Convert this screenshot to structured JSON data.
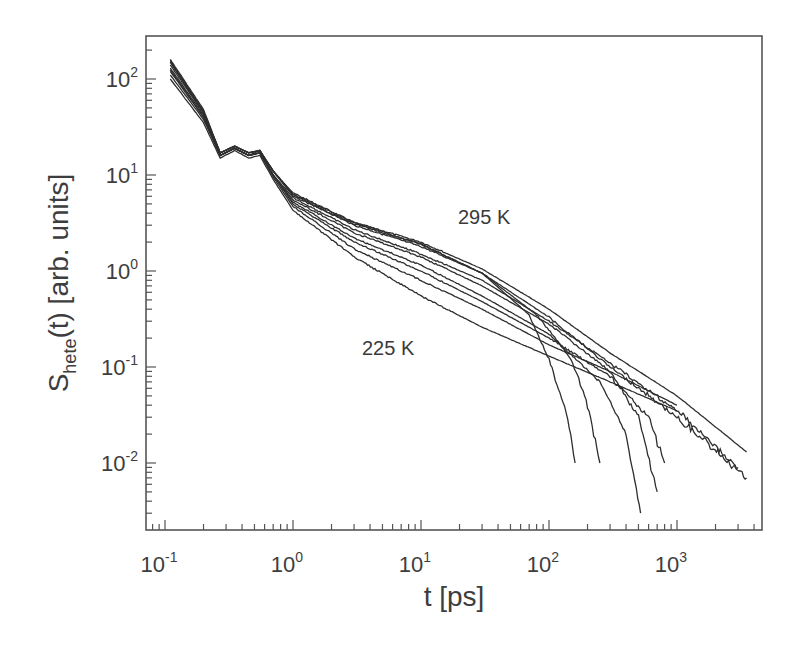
{
  "chart_data": {
    "type": "line",
    "title": "",
    "xlabel": "t [ps]",
    "ylabel": "S_hete(t)  [arb. units]",
    "ylabel_main": "S",
    "ylabel_sub": "hete",
    "ylabel_rest": "(t)  [arb. units]",
    "xscale": "log",
    "yscale": "log",
    "xlim": [
      0.07,
      4900
    ],
    "ylim": [
      0.002,
      290
    ],
    "grid": false,
    "legend": "none",
    "x_ticks": [
      {
        "base": "10",
        "exp": "-1",
        "value": 0.1
      },
      {
        "base": "10",
        "exp": "0",
        "value": 1
      },
      {
        "base": "10",
        "exp": "1",
        "value": 10
      },
      {
        "base": "10",
        "exp": "2",
        "value": 100
      },
      {
        "base": "10",
        "exp": "3",
        "value": 1000
      }
    ],
    "y_ticks": [
      {
        "base": "10",
        "exp": "2",
        "value": 100
      },
      {
        "base": "10",
        "exp": "1",
        "value": 10
      },
      {
        "base": "10",
        "exp": "0",
        "value": 1
      },
      {
        "base": "10",
        "exp": "-1",
        "value": 0.1
      },
      {
        "base": "10",
        "exp": "-2",
        "value": 0.01
      }
    ],
    "annotations": [
      {
        "text": "295 K",
        "x": 40,
        "y": 3.0
      },
      {
        "text": "225 K",
        "x": 4,
        "y": 0.12
      }
    ],
    "series_description": "Ten temperature curves from 225 K to 295 K; all coincide below ~1 ps and fan out at longer times; several curves drop sharply (noisy) between 100 and 800 ps.",
    "series": [
      {
        "name": "curve-1",
        "cutoff": 3500,
        "noisy_end": false,
        "points": [
          [
            0.11,
            150
          ],
          [
            0.2,
            45
          ],
          [
            0.27,
            17
          ],
          [
            0.35,
            20
          ],
          [
            0.45,
            17
          ],
          [
            0.55,
            18
          ],
          [
            0.7,
            11
          ],
          [
            1,
            6.5
          ],
          [
            3,
            3.2
          ],
          [
            10,
            2.0
          ],
          [
            30,
            1.05
          ],
          [
            100,
            0.4
          ],
          [
            300,
            0.14
          ],
          [
            1000,
            0.05
          ],
          [
            3500,
            0.013
          ]
        ]
      },
      {
        "name": "curve-2",
        "cutoff": 3500,
        "noisy_end": true,
        "points": [
          [
            0.11,
            160
          ],
          [
            0.2,
            48
          ],
          [
            0.27,
            17
          ],
          [
            0.35,
            20
          ],
          [
            0.45,
            17
          ],
          [
            0.55,
            18
          ],
          [
            0.7,
            11
          ],
          [
            1,
            6.2
          ],
          [
            3,
            3.0
          ],
          [
            10,
            1.8
          ],
          [
            30,
            0.95
          ],
          [
            100,
            0.33
          ],
          [
            300,
            0.1
          ],
          [
            1000,
            0.03
          ],
          [
            3500,
            0.007
          ]
        ]
      },
      {
        "name": "curve-3",
        "cutoff": 3000,
        "noisy_end": true,
        "points": [
          [
            0.11,
            140
          ],
          [
            0.2,
            44
          ],
          [
            0.27,
            16
          ],
          [
            0.35,
            19
          ],
          [
            0.45,
            16
          ],
          [
            0.55,
            18
          ],
          [
            0.7,
            10
          ],
          [
            1,
            5.8
          ],
          [
            3,
            2.7
          ],
          [
            10,
            1.5
          ],
          [
            30,
            0.8
          ],
          [
            100,
            0.3
          ],
          [
            300,
            0.11
          ],
          [
            1000,
            0.035
          ],
          [
            3000,
            0.009
          ]
        ]
      },
      {
        "name": "curve-4",
        "cutoff": 250,
        "noisy_end": true,
        "points": [
          [
            0.11,
            150
          ],
          [
            0.2,
            45
          ],
          [
            0.27,
            17
          ],
          [
            0.35,
            20
          ],
          [
            0.45,
            17
          ],
          [
            0.55,
            18
          ],
          [
            0.7,
            11
          ],
          [
            1,
            6.0
          ],
          [
            3,
            3.1
          ],
          [
            10,
            1.9
          ],
          [
            30,
            0.95
          ],
          [
            80,
            0.35
          ],
          [
            150,
            0.12
          ],
          [
            200,
            0.04
          ],
          [
            250,
            0.01
          ]
        ]
      },
      {
        "name": "curve-5",
        "cutoff": 160,
        "noisy_end": true,
        "points": [
          [
            0.11,
            155
          ],
          [
            0.2,
            46
          ],
          [
            0.27,
            17
          ],
          [
            0.35,
            20
          ],
          [
            0.45,
            17
          ],
          [
            0.55,
            18
          ],
          [
            0.7,
            11
          ],
          [
            1,
            6.3
          ],
          [
            3,
            3.2
          ],
          [
            10,
            1.9
          ],
          [
            30,
            0.95
          ],
          [
            70,
            0.35
          ],
          [
            100,
            0.12
          ],
          [
            140,
            0.03
          ],
          [
            160,
            0.01
          ]
        ]
      },
      {
        "name": "curve-6",
        "cutoff": 700,
        "noisy_end": true,
        "points": [
          [
            0.11,
            130
          ],
          [
            0.2,
            42
          ],
          [
            0.27,
            16
          ],
          [
            0.35,
            19
          ],
          [
            0.45,
            16
          ],
          [
            0.55,
            17
          ],
          [
            0.7,
            10
          ],
          [
            1,
            5.5
          ],
          [
            3,
            2.5
          ],
          [
            10,
            1.4
          ],
          [
            30,
            0.7
          ],
          [
            100,
            0.28
          ],
          [
            300,
            0.09
          ],
          [
            500,
            0.03
          ],
          [
            700,
            0.005
          ]
        ]
      },
      {
        "name": "curve-7",
        "cutoff": 520,
        "noisy_end": true,
        "points": [
          [
            0.11,
            120
          ],
          [
            0.2,
            40
          ],
          [
            0.27,
            16
          ],
          [
            0.35,
            19
          ],
          [
            0.45,
            16
          ],
          [
            0.55,
            17
          ],
          [
            0.7,
            10
          ],
          [
            1,
            5.2
          ],
          [
            3,
            2.2
          ],
          [
            10,
            1.15
          ],
          [
            30,
            0.55
          ],
          [
            100,
            0.22
          ],
          [
            250,
            0.07
          ],
          [
            400,
            0.02
          ],
          [
            520,
            0.003
          ]
        ]
      },
      {
        "name": "curve-8",
        "cutoff": 800,
        "noisy_end": true,
        "points": [
          [
            0.11,
            125
          ],
          [
            0.2,
            40
          ],
          [
            0.27,
            16
          ],
          [
            0.35,
            19
          ],
          [
            0.45,
            16
          ],
          [
            0.55,
            17
          ],
          [
            0.7,
            10
          ],
          [
            1,
            5.0
          ],
          [
            3,
            2.0
          ],
          [
            10,
            1.0
          ],
          [
            30,
            0.48
          ],
          [
            100,
            0.2
          ],
          [
            300,
            0.08
          ],
          [
            600,
            0.03
          ],
          [
            800,
            0.01
          ]
        ]
      },
      {
        "name": "curve-9",
        "cutoff": 1000,
        "noisy_end": false,
        "points": [
          [
            0.11,
            110
          ],
          [
            0.2,
            38
          ],
          [
            0.27,
            16
          ],
          [
            0.35,
            19
          ],
          [
            0.45,
            16
          ],
          [
            0.55,
            17
          ],
          [
            0.7,
            9.5
          ],
          [
            1,
            4.7
          ],
          [
            3,
            1.7
          ],
          [
            10,
            0.8
          ],
          [
            30,
            0.4
          ],
          [
            100,
            0.17
          ],
          [
            300,
            0.09
          ],
          [
            1000,
            0.04
          ]
        ]
      },
      {
        "name": "curve-10",
        "cutoff": 1000,
        "noisy_end": false,
        "points": [
          [
            0.11,
            100
          ],
          [
            0.2,
            35
          ],
          [
            0.27,
            15
          ],
          [
            0.35,
            18
          ],
          [
            0.45,
            15
          ],
          [
            0.55,
            16
          ],
          [
            0.7,
            9
          ],
          [
            1,
            4.3
          ],
          [
            3,
            1.4
          ],
          [
            10,
            0.55
          ],
          [
            30,
            0.26
          ],
          [
            100,
            0.13
          ],
          [
            300,
            0.07
          ],
          [
            1000,
            0.035
          ]
        ]
      }
    ]
  }
}
